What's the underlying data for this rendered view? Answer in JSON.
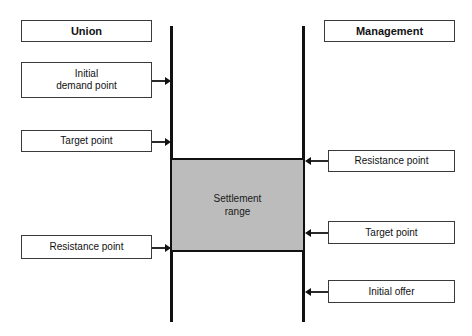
{
  "diagram": {
    "background_color": "#ffffff",
    "line_color": "#111111",
    "settlement_fill": "#bcbcbc"
  },
  "union": {
    "header": "Union",
    "boxes": [
      {
        "label": "Initial\ndemand point",
        "arrow": "right"
      },
      {
        "label": "Target point",
        "arrow": "right"
      },
      {
        "label": "Resistance point",
        "arrow": "right"
      }
    ]
  },
  "management": {
    "header": "Management",
    "boxes": [
      {
        "label": "Resistance  point",
        "arrow": "left"
      },
      {
        "label": "Target point",
        "arrow": "left"
      },
      {
        "label": "Initial  offer",
        "arrow": "left"
      }
    ]
  },
  "settlement": {
    "label": "Settlement\nrange"
  }
}
